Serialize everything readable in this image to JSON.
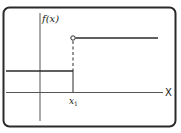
{
  "diagram": {
    "type": "step-function-graph",
    "y_axis_label": "f(x)",
    "x_axis_label": "X",
    "point_label": "x",
    "point_subscript": "1",
    "colors": {
      "stroke": "#2a2a2a",
      "frame": "#2a2a2a",
      "axis": "#555555",
      "background": "#ffffff"
    },
    "segments": [
      {
        "name": "lower",
        "from_x": "-inf",
        "to_x": "x1",
        "closed_end": true
      },
      {
        "name": "upper",
        "from_x": "x1",
        "to_x": "+inf",
        "open_start": true
      }
    ]
  }
}
